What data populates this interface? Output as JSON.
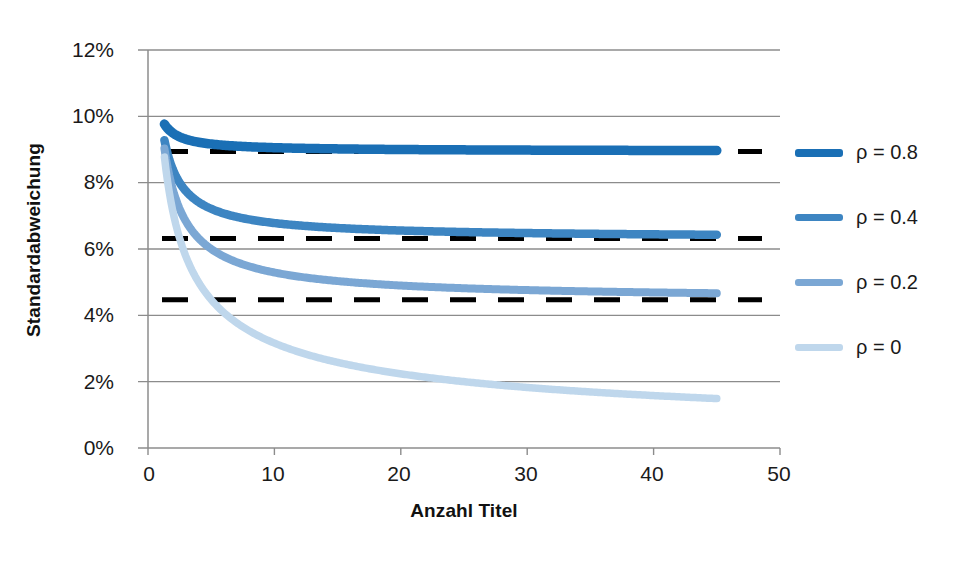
{
  "chart_data": {
    "type": "line",
    "title": "",
    "xlabel": "Anzahl Titel",
    "ylabel": "Standardabweichung",
    "xlim": [
      0,
      50
    ],
    "ylim": [
      0,
      0.12
    ],
    "xticks": [
      "0",
      "10",
      "20",
      "30",
      "40",
      "50"
    ],
    "xtick_values": [
      0,
      10,
      20,
      30,
      40,
      50
    ],
    "yticks": [
      "0%",
      "2%",
      "4%",
      "6%",
      "8%",
      "10%",
      "12%"
    ],
    "ytick_values": [
      0,
      0.02,
      0.04,
      0.06,
      0.08,
      0.1,
      0.12
    ],
    "grid": "horizontal",
    "legend_position": "right",
    "x_domain_data": [
      1.3,
      45
    ],
    "formula_note": "sigma(n) = 0.10 * sqrt(rho + (1-rho)/n)",
    "series": [
      {
        "name": "ρ = 0.8",
        "rho": 0.8,
        "color": "#1A6FB5",
        "asymptote": 0.0894,
        "x": [
          1.3,
          2,
          3,
          4,
          5,
          6,
          8,
          10,
          12,
          15,
          20,
          25,
          30,
          35,
          40,
          45
        ],
        "values": [
          0.0986,
          0.0949,
          0.093,
          0.0922,
          0.0917,
          0.0913,
          0.0909,
          0.0906,
          0.0905,
          0.0903,
          0.09,
          0.0899,
          0.0898,
          0.0897,
          0.0897,
          0.0896
        ]
      },
      {
        "name": "ρ = 0.4",
        "rho": 0.4,
        "color": "#3D85C2",
        "asymptote": 0.0632,
        "x": [
          1.3,
          2,
          3,
          4,
          5,
          6,
          8,
          10,
          12,
          15,
          20,
          25,
          30,
          35,
          40,
          45
        ],
        "values": [
          0.0959,
          0.0837,
          0.0775,
          0.0742,
          0.0721,
          0.0707,
          0.0689,
          0.0678,
          0.0671,
          0.0663,
          0.0656,
          0.0651,
          0.0648,
          0.0646,
          0.0645,
          0.0643
        ]
      },
      {
        "name": "ρ = 0.2",
        "rho": 0.2,
        "color": "#7BA7D4",
        "asymptote": 0.0447,
        "x": [
          1.3,
          2,
          3,
          4,
          5,
          6,
          8,
          10,
          12,
          15,
          20,
          25,
          30,
          35,
          40,
          45
        ],
        "values": [
          0.0938,
          0.0775,
          0.0683,
          0.0632,
          0.06,
          0.0577,
          0.0548,
          0.0529,
          0.0516,
          0.0503,
          0.049,
          0.0482,
          0.0476,
          0.0472,
          0.0469,
          0.0467
        ]
      },
      {
        "name": "ρ = 0",
        "rho": 0,
        "color": "#BFD7EC",
        "asymptote": null,
        "x": [
          1.3,
          2,
          3,
          4,
          5,
          6,
          8,
          10,
          12,
          15,
          20,
          25,
          30,
          35,
          40,
          45
        ],
        "values": [
          0.0877,
          0.0707,
          0.0577,
          0.05,
          0.0447,
          0.0408,
          0.0354,
          0.0316,
          0.0289,
          0.0258,
          0.0224,
          0.02,
          0.0183,
          0.0169,
          0.0158,
          0.0149
        ]
      }
    ],
    "reference_lines": [
      {
        "label": "ρ = 0.8 asymptote",
        "value": 0.0894,
        "style": "dashed",
        "color": "#000000"
      },
      {
        "label": "ρ = 0.4 asymptote",
        "value": 0.0632,
        "style": "dashed",
        "color": "#000000"
      },
      {
        "label": "ρ = 0.2 asymptote",
        "value": 0.0447,
        "style": "dashed",
        "color": "#000000"
      }
    ]
  },
  "legend": {
    "items": [
      {
        "label": "ρ = 0.8",
        "color": "#1A6FB5"
      },
      {
        "label": "ρ = 0.4",
        "color": "#3D85C2"
      },
      {
        "label": "ρ = 0.2",
        "color": "#7BA7D4"
      },
      {
        "label": "ρ = 0",
        "color": "#BFD7EC"
      }
    ]
  },
  "axes": {
    "x_title": "Anzahl Titel",
    "y_title": "Standardabweichung",
    "x_tick_labels": [
      "0",
      "10",
      "20",
      "30",
      "40",
      "50"
    ],
    "y_tick_labels": [
      "0%",
      "2%",
      "4%",
      "6%",
      "8%",
      "10%",
      "12%"
    ]
  },
  "colors": {
    "grid": "#8c8c8c",
    "axis": "#8c8c8c",
    "text": "#1a1a1a",
    "reference": "#000000"
  }
}
